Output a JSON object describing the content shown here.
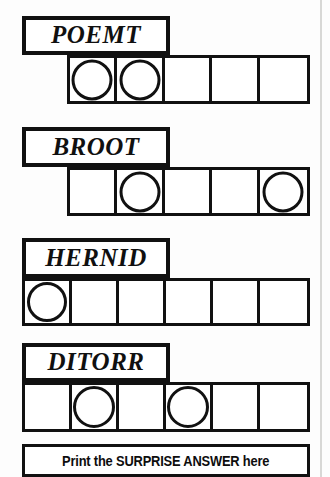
{
  "puzzle": {
    "title": "Scrambled word puzzle",
    "banner": {
      "text": "Print the SURPRISE ANSWER here"
    },
    "ink_color": "#111111",
    "paper_color": "#fdfdfd",
    "rows": [
      {
        "clue": "POEMT",
        "cell_count": 5,
        "circled_cells": [
          1,
          2
        ],
        "label": {
          "x": 22,
          "y": 16,
          "width": 148,
          "height": 39
        },
        "grid": {
          "x": 67,
          "y": 55,
          "width": 243,
          "height": 49
        }
      },
      {
        "clue": "BROOT",
        "cell_count": 5,
        "circled_cells": [
          2,
          5
        ],
        "label": {
          "x": 22,
          "y": 127,
          "width": 148,
          "height": 40
        },
        "grid": {
          "x": 67,
          "y": 167,
          "width": 243,
          "height": 49
        }
      },
      {
        "clue": "HERNID",
        "cell_count": 6,
        "circled_cells": [
          1
        ],
        "label": {
          "x": 22,
          "y": 238,
          "width": 148,
          "height": 40
        },
        "grid": {
          "x": 22,
          "y": 278,
          "width": 288,
          "height": 48
        }
      },
      {
        "clue": "DITORR",
        "cell_count": 6,
        "circled_cells": [
          2,
          4
        ],
        "label": {
          "x": 22,
          "y": 343,
          "width": 148,
          "height": 39
        },
        "grid": {
          "x": 22,
          "y": 382,
          "width": 288,
          "height": 50
        }
      }
    ],
    "banner_box": {
      "x": 22,
      "y": 444,
      "width": 288,
      "height": 33
    }
  }
}
